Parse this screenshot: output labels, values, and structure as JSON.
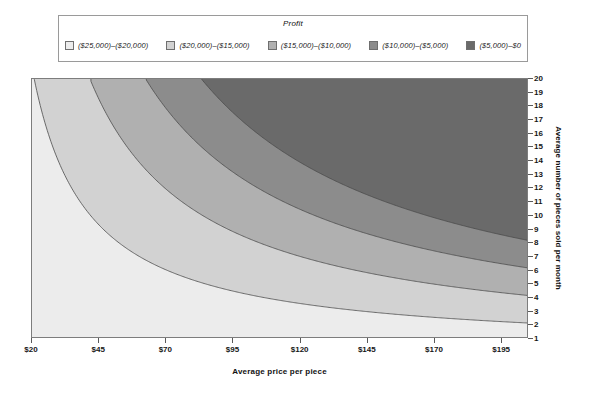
{
  "legend": {
    "title": "Profit",
    "items": [
      {
        "label": "($25,000)–($20,000)",
        "color": "#ececec"
      },
      {
        "label": "($20,000)–($15,000)",
        "color": "#d2d2d2"
      },
      {
        "label": "($15,000)–($10,000)",
        "color": "#b0b0b0"
      },
      {
        "label": "($10,000)–($5,000)",
        "color": "#8c8c8c"
      },
      {
        "label": "($5,000)–$0",
        "color": "#6a6a6a"
      }
    ]
  },
  "chart_data": {
    "type": "heatmap",
    "title": "",
    "xlabel": "Average price per piece",
    "ylabel": "Average number of pieces sold per month",
    "xlim": [
      20,
      205
    ],
    "ylim": [
      1,
      20
    ],
    "grid": false,
    "legend_position": "top",
    "legend_title": "Profit",
    "x_ticks": [
      "$20",
      "$45",
      "$70",
      "$95",
      "$120",
      "$145",
      "$170",
      "$195"
    ],
    "x_tick_values": [
      20,
      45,
      70,
      95,
      120,
      145,
      170,
      195
    ],
    "y_ticks": [
      "1",
      "2",
      "3",
      "4",
      "5",
      "6",
      "7",
      "8",
      "9",
      "10",
      "11",
      "12",
      "13",
      "14",
      "15",
      "16",
      "17",
      "18",
      "19",
      "20"
    ],
    "y_tick_values": [
      1,
      2,
      3,
      4,
      5,
      6,
      7,
      8,
      9,
      10,
      11,
      12,
      13,
      14,
      15,
      16,
      17,
      18,
      19,
      20
    ],
    "bands": [
      {
        "name": "($25,000)–($20,000)",
        "low": -25000,
        "high": -20000,
        "color": "#ececec"
      },
      {
        "name": "($20,000)–($15,000)",
        "low": -20000,
        "high": -15000,
        "color": "#d2d2d2"
      },
      {
        "name": "($15,000)–($10,000)",
        "low": -15000,
        "high": -10000,
        "color": "#b0b0b0"
      },
      {
        "name": "($10,000)–($5,000)",
        "low": -10000,
        "high": -5000,
        "color": "#8c8c8c"
      },
      {
        "name": "($5,000)–$0",
        "low": -5000,
        "high": 0,
        "color": "#6a6a6a"
      }
    ],
    "contour_levels": [
      -20000,
      -15000,
      -10000,
      -5000
    ],
    "model": {
      "description": "profit = price * quantity * 12 - fixed_cost",
      "fixed_cost": 25000,
      "months_per_year": 12
    }
  }
}
